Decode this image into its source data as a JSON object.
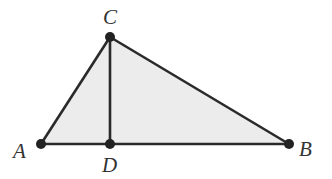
{
  "diagram": {
    "type": "geometry-triangle",
    "fill_color": "#ececec",
    "stroke_color": "#2a2a2a",
    "points": {
      "A": {
        "label": "A",
        "x": 41,
        "y": 144
      },
      "B": {
        "label": "B",
        "x": 289,
        "y": 144
      },
      "C": {
        "label": "C",
        "x": 110,
        "y": 37
      },
      "D": {
        "label": "D",
        "x": 110,
        "y": 144
      }
    },
    "segments": [
      "AB",
      "BC",
      "CA",
      "CD"
    ],
    "labels": {
      "A": "A",
      "B": "B",
      "C": "C",
      "D": "D"
    }
  }
}
